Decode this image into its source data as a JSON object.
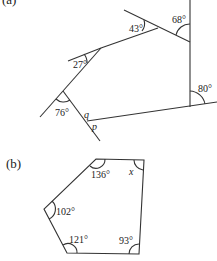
{
  "figure_a": {
    "label": "(a)",
    "angles": [
      {
        "id": "angle-43",
        "text": "43°"
      },
      {
        "id": "angle-68",
        "text": "68°"
      },
      {
        "id": "angle-27",
        "text": "27°"
      },
      {
        "id": "angle-76",
        "text": "76°"
      },
      {
        "id": "angle-80",
        "text": "80°"
      }
    ],
    "variables": {
      "q": "q",
      "p": "p"
    }
  },
  "figure_b": {
    "label": "(b)",
    "angles": [
      {
        "id": "angle-136",
        "text": "136°"
      },
      {
        "id": "angle-x",
        "text": "x"
      },
      {
        "id": "angle-102",
        "text": "102°"
      },
      {
        "id": "angle-121",
        "text": "121°"
      },
      {
        "id": "angle-93",
        "text": "93°"
      }
    ]
  },
  "colors": {
    "stroke": "#333333",
    "background": "#ffffff"
  }
}
